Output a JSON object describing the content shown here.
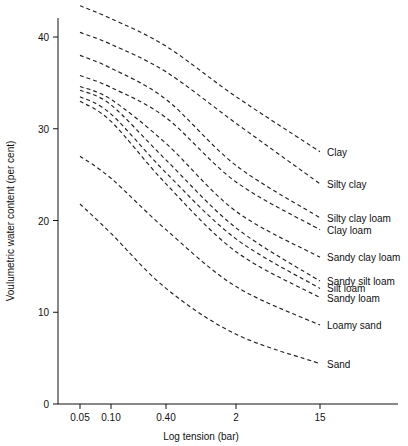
{
  "chart_data": {
    "type": "line",
    "title": "",
    "xlabel": "Log tension (bar)",
    "ylabel": "Voulumetric water content (per cent)",
    "xticklabels": [
      "0.05",
      "0.10",
      "0.40",
      "2",
      "15"
    ],
    "xtickvalues": [
      0.05,
      0.1,
      0.4,
      2,
      15
    ],
    "yticklabels": [
      "0",
      "10",
      "20",
      "30",
      "40"
    ],
    "ytickvalues": [
      0,
      10,
      20,
      30,
      40
    ],
    "ylim": [
      0,
      45
    ],
    "xscale": "log",
    "grid": false,
    "legend_position": "right-inline",
    "linestyle": "dashed",
    "series": [
      {
        "name": "Clay",
        "x": [
          0.05,
          0.1,
          0.4,
          2,
          15
        ],
        "y": [
          43.4,
          42.0,
          39.0,
          33.5,
          27.5
        ]
      },
      {
        "name": "Silty clay",
        "x": [
          0.05,
          0.1,
          0.4,
          2,
          15
        ],
        "y": [
          40.5,
          39.2,
          36.2,
          30.6,
          24.0
        ]
      },
      {
        "name": "Silty clay loam",
        "x": [
          0.05,
          0.1,
          0.4,
          2,
          15
        ],
        "y": [
          38.0,
          36.6,
          33.2,
          26.0,
          20.3
        ]
      },
      {
        "name": "Clay loam",
        "x": [
          0.05,
          0.1,
          0.4,
          2,
          15
        ],
        "y": [
          35.8,
          34.5,
          31.2,
          24.2,
          19.0
        ]
      },
      {
        "name": "Sandy clay loam",
        "x": [
          0.05,
          0.1,
          0.4,
          2,
          15
        ],
        "y": [
          34.6,
          33.2,
          28.4,
          21.0,
          16.0
        ]
      },
      {
        "name": "Sandy silt loam",
        "x": [
          0.05,
          0.1,
          0.4,
          2,
          15
        ],
        "y": [
          34.2,
          32.6,
          26.6,
          19.2,
          13.4
        ]
      },
      {
        "name": "Silt loam",
        "x": [
          0.05,
          0.1,
          0.4,
          2,
          15
        ],
        "y": [
          33.5,
          31.6,
          25.2,
          18.0,
          12.6
        ]
      },
      {
        "name": "Sandy loam",
        "x": [
          0.05,
          0.1,
          0.4,
          2,
          15
        ],
        "y": [
          33.0,
          30.8,
          24.0,
          16.6,
          11.6
        ]
      },
      {
        "name": "Loamy sand",
        "x": [
          0.05,
          0.1,
          0.4,
          2,
          15
        ],
        "y": [
          27.0,
          24.6,
          19.0,
          12.8,
          8.6
        ]
      },
      {
        "name": "Sand",
        "x": [
          0.05,
          0.1,
          0.4,
          2,
          15
        ],
        "y": [
          21.8,
          18.6,
          12.6,
          7.6,
          4.4
        ]
      }
    ],
    "labels": [
      {
        "text": "Clay",
        "y": 27.5
      },
      {
        "text": "Silty clay",
        "y": 24.0
      },
      {
        "text": "Silty clay loam",
        "y": 20.3
      },
      {
        "text": "Clay loam",
        "y": 19.0
      },
      {
        "text": "Sandy clay loam",
        "y": 16.0
      },
      {
        "text": "Sandy silt loam",
        "y": 13.4
      },
      {
        "text": "Silt loam",
        "y": 12.6
      },
      {
        "text": "Sandy loam",
        "y": 11.6
      },
      {
        "text": "Loamy sand",
        "y": 8.6
      },
      {
        "text": "Sand",
        "y": 4.4
      }
    ]
  }
}
